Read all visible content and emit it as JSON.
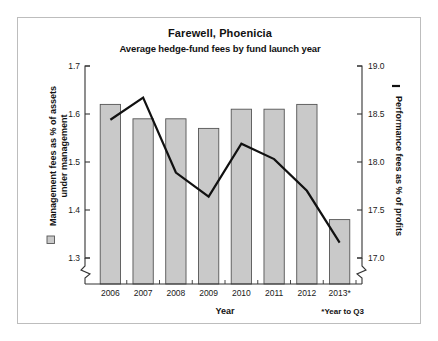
{
  "chart_data": {
    "type": "bar",
    "title": "Farewell, Phoenicia",
    "subtitle": "Average hedge-fund fees by fund launch year",
    "xlabel": "Year",
    "categories": [
      "2006",
      "2007",
      "2008",
      "2009",
      "2010",
      "2011",
      "2012",
      "2013*"
    ],
    "grid": false,
    "legend_position": "axis-titles",
    "footnote": "*Year to Q3",
    "left_axis": {
      "label": "Management fees as % of assets under management",
      "ticks": [
        "1.3",
        "1.4",
        "1.5",
        "1.6",
        "1.7"
      ],
      "ylim": [
        1.3,
        1.7
      ],
      "axis_break": true,
      "legend_marker": "filled-square"
    },
    "right_axis": {
      "label": "Performance fees as % of profits",
      "ticks": [
        "17.0",
        "17.5",
        "18.0",
        "18.5",
        "19.0"
      ],
      "ylim": [
        17.0,
        19.0
      ],
      "axis_break": true,
      "legend_marker": "solid-line"
    },
    "series": [
      {
        "name": "Management fees as % of assets under management",
        "type": "bar",
        "axis": "left",
        "color": "#c9c9c9",
        "edge_color": "#555555",
        "values": [
          1.62,
          1.59,
          1.59,
          1.57,
          1.61,
          1.61,
          1.62,
          1.38
        ]
      },
      {
        "name": "Performance fees as % of profits",
        "type": "line",
        "axis": "right",
        "color": "#111111",
        "values": [
          18.44,
          18.67,
          17.89,
          17.64,
          18.19,
          18.03,
          17.7,
          17.16
        ]
      }
    ]
  }
}
